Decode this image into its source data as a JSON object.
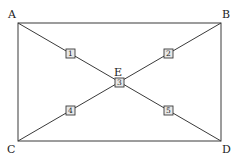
{
  "diagram": {
    "vertices": {
      "A": "A",
      "B": "B",
      "C": "C",
      "D": "D",
      "E": "E"
    },
    "edges": [
      {
        "from": "A",
        "to": "B"
      },
      {
        "from": "B",
        "to": "D"
      },
      {
        "from": "D",
        "to": "C"
      },
      {
        "from": "C",
        "to": "A"
      },
      {
        "from": "A",
        "to": "D"
      },
      {
        "from": "B",
        "to": "C"
      }
    ],
    "markers": [
      {
        "label": "1",
        "on": "A-E"
      },
      {
        "label": "2",
        "on": "B-E"
      },
      {
        "label": "3",
        "on": "E"
      },
      {
        "label": "4",
        "on": "C-E"
      },
      {
        "label": "5",
        "on": "D-E"
      }
    ]
  }
}
